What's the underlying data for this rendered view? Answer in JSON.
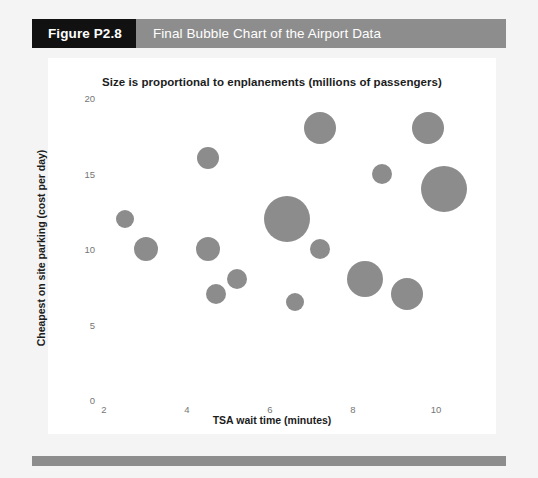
{
  "header": {
    "tag": "Figure P2.8",
    "caption": "Final Bubble Chart of the Airport Data",
    "tag_bg": "#111111",
    "bar_bg": "#8d8d8d"
  },
  "footer": {
    "bar_bg": "#8d8d8d"
  },
  "chart_data": {
    "type": "scatter",
    "title": "Size is proportional to enplanements (millions of passengers)",
    "xlabel": "TSA wait time (minutes)",
    "ylabel": "Cheapest on site parking (cost per day)",
    "xlim": [
      2,
      10.8
    ],
    "ylim": [
      0,
      20
    ],
    "xticks": [
      2,
      4,
      6,
      8,
      10
    ],
    "yticks": [
      0,
      5,
      10,
      15,
      20
    ],
    "xtick_labels": [
      "2",
      "4",
      "6",
      "8",
      "10"
    ],
    "ytick_labels": [
      "0",
      "5",
      "10",
      "15",
      "20"
    ],
    "grid": false,
    "legend": "none",
    "bubble_color": "#8c8c8c",
    "size_note": "Size is proportional to enplanements (millions of passengers)",
    "points": [
      {
        "x": 2.5,
        "y": 12.0,
        "size": 9
      },
      {
        "x": 3.0,
        "y": 10.0,
        "size": 12
      },
      {
        "x": 4.5,
        "y": 16.0,
        "size": 11
      },
      {
        "x": 4.5,
        "y": 10.0,
        "size": 12
      },
      {
        "x": 4.7,
        "y": 7.0,
        "size": 10
      },
      {
        "x": 5.2,
        "y": 8.0,
        "size": 10
      },
      {
        "x": 6.4,
        "y": 12.0,
        "size": 23
      },
      {
        "x": 6.6,
        "y": 6.5,
        "size": 9
      },
      {
        "x": 7.2,
        "y": 18.0,
        "size": 16
      },
      {
        "x": 7.2,
        "y": 10.0,
        "size": 10
      },
      {
        "x": 8.3,
        "y": 8.0,
        "size": 18
      },
      {
        "x": 8.7,
        "y": 15.0,
        "size": 10
      },
      {
        "x": 9.3,
        "y": 7.0,
        "size": 16
      },
      {
        "x": 9.8,
        "y": 18.0,
        "size": 16
      },
      {
        "x": 10.2,
        "y": 14.0,
        "size": 23
      }
    ]
  }
}
